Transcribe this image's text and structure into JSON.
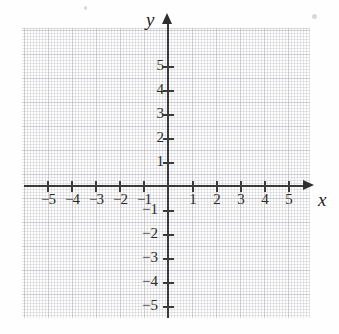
{
  "figure": {
    "type": "coordinate-plane",
    "title": ""
  },
  "axes": {
    "x_name": "x",
    "y_name": "y",
    "x_label_positions": {
      "name_left": 318,
      "name_top": 190
    },
    "y_label_positions": {
      "name_left": 146,
      "name_top": 10
    }
  },
  "chart_data": {
    "type": "scatter",
    "title": "",
    "subtitle": "",
    "xlabel": "x",
    "ylabel": "y",
    "xlim": [
      -6,
      6
    ],
    "ylim": [
      -6,
      6
    ],
    "xticks": [
      -5,
      -4,
      -3,
      -2,
      -1,
      1,
      2,
      3,
      4,
      5
    ],
    "yticks": [
      5,
      4,
      3,
      2,
      1,
      -1,
      -2,
      -3,
      -4,
      -5
    ],
    "xticklabels": [
      "−5",
      "−4",
      "−3",
      "−2",
      "−1",
      "1",
      "2",
      "3",
      "4",
      "5"
    ],
    "yticklabels": [
      "5",
      "4",
      "3",
      "2",
      "1",
      "−1",
      "−2",
      "−3",
      "−4",
      "−5"
    ],
    "grid": true,
    "grid_style": "dotted",
    "legend": false,
    "series": [
      {
        "name": "data",
        "x": [],
        "y": []
      }
    ],
    "annotations": []
  },
  "ticks": {
    "x": [
      {
        "value": -5,
        "label": "−5",
        "px": 47
      },
      {
        "value": -4,
        "label": "−4",
        "px": 71
      },
      {
        "value": -3,
        "label": "−3",
        "px": 95
      },
      {
        "value": -2,
        "label": "−2",
        "px": 119
      },
      {
        "value": -1,
        "label": "−1",
        "px": 143
      },
      {
        "value": 1,
        "label": "1",
        "px": 192
      },
      {
        "value": 2,
        "label": "2",
        "px": 216
      },
      {
        "value": 3,
        "label": "3",
        "px": 240
      },
      {
        "value": 4,
        "label": "4",
        "px": 264
      },
      {
        "value": 5,
        "label": "5",
        "px": 288
      }
    ],
    "y": [
      {
        "value": 5,
        "label": "5",
        "px": 66
      },
      {
        "value": 4,
        "label": "4",
        "px": 90
      },
      {
        "value": 3,
        "label": "3",
        "px": 114
      },
      {
        "value": 2,
        "label": "2",
        "px": 138
      },
      {
        "value": 1,
        "label": "1",
        "px": 162
      },
      {
        "value": -1,
        "label": "−1",
        "px": 210
      },
      {
        "value": -2,
        "label": "−2",
        "px": 234
      },
      {
        "value": -3,
        "label": "−3",
        "px": 258
      },
      {
        "value": -4,
        "label": "−4",
        "px": 282
      },
      {
        "value": -5,
        "label": "−5",
        "px": 306
      }
    ]
  },
  "colors": {
    "background": "#fefefe",
    "axis": "#3a3a3a",
    "grid": "#9a9aa2",
    "label": "#2b2b2b"
  }
}
